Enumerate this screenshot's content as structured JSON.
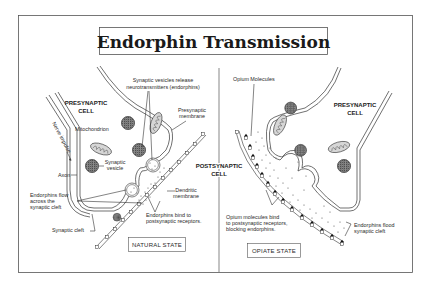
{
  "title": "Endorphin Transmission",
  "left_panel": {
    "state_label": "NATURAL STATE",
    "presynaptic_cell": [
      "PRESYNAPTIC",
      "CELL"
    ],
    "labels": {
      "vesicles_release": [
        "Synaptic vesicles release",
        "neurotransmitters (endorphins)"
      ],
      "presynaptic_membrane": [
        "Presynaptic",
        "membrane"
      ],
      "mitochondrion": "Mitochondrion",
      "nerve_impulse": "Nerve impulse",
      "synaptic_vesicle": [
        "Synaptic",
        "vesicle"
      ],
      "axon": "Axon",
      "endorphins_flow": [
        "Endorphins flow",
        "across the",
        "synaptic cleft"
      ],
      "synaptic_cleft": "Synaptic cleft",
      "dendritic_membrane": [
        "Dendritic",
        "membrane"
      ],
      "endorphins_bind": [
        "Endorphins bind to",
        "postsynaptic receptors."
      ]
    }
  },
  "center": {
    "postsynaptic_cell": [
      "POSTSYNAPTIC",
      "CELL"
    ]
  },
  "right_panel": {
    "state_label": "OPIATE STATE",
    "presynaptic_cell": [
      "PRESYNAPTIC",
      "CELL"
    ],
    "labels": {
      "opium_molecules": "Opium Molecules",
      "opium_bind": [
        "Opium molecules bind",
        "to postsynaptic receptors,",
        "blocking endorphins."
      ],
      "endorphins_flood": [
        "Endorphins flood",
        "synaptic cleft"
      ]
    }
  },
  "colors": {
    "ink": "#333333",
    "background": "#ffffff",
    "vesicle_fill": "#777777",
    "mito_fill": "#cfcfcf"
  }
}
